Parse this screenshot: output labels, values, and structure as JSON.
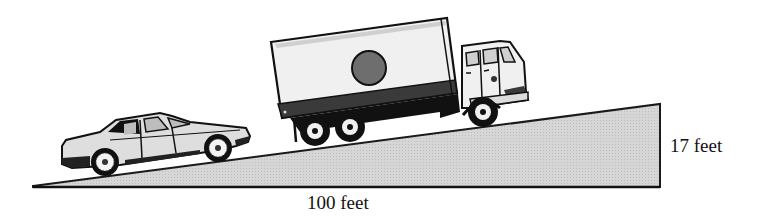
{
  "figure": {
    "labels": {
      "base": "100 feet",
      "height": "17 feet"
    },
    "ramp": {
      "run_feet": 100,
      "rise_feet": 17,
      "fill_color": "#d4d4d4",
      "stroke_color": "#1a1a1a"
    },
    "vehicles": [
      {
        "type": "car",
        "name": "sedan"
      },
      {
        "type": "truck",
        "name": "box truck",
        "emblem": "circle"
      }
    ],
    "colors": {
      "outline": "#111111",
      "body_light": "#eeeeee",
      "body_mid": "#bdbdbd",
      "dark_stripe": "#3a3a3a",
      "emblem": "#6e6e6e"
    }
  }
}
